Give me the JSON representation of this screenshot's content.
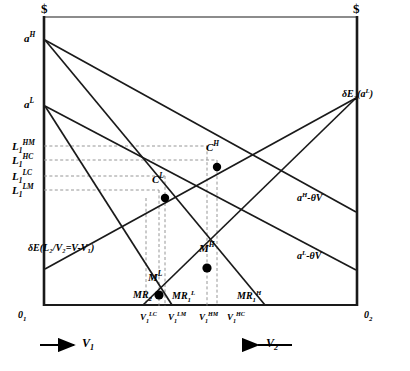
{
  "figure": {
    "type": "economics-diagram",
    "axes": {
      "left_currency_symbol": "$",
      "right_currency_symbol": "$",
      "origin_left": "0",
      "origin_left_sub": "1",
      "origin_right": "0",
      "origin_right_sub": "2"
    },
    "y_axis_intercepts": [
      {
        "id": "a-high",
        "base": "a",
        "sup": "H",
        "x": 30,
        "y": 38
      },
      {
        "id": "a-low",
        "base": "a",
        "sup": "L",
        "x": 30,
        "y": 104
      }
    ],
    "y_axis_ticks": [
      {
        "id": "L1-HM",
        "base": "L",
        "sub": "1",
        "sup": "HM",
        "y": 146
      },
      {
        "id": "L1-HC",
        "base": "L",
        "sub": "1",
        "sup": "HC",
        "y": 160
      },
      {
        "id": "L1-LC",
        "base": "L",
        "sub": "1",
        "sup": "LC",
        "y": 176
      },
      {
        "id": "L1-LM",
        "base": "L",
        "sub": "1",
        "sup": "LM",
        "y": 190
      }
    ],
    "x_axis_ticks": [
      {
        "id": "V1-LC",
        "base": "V",
        "sub": "1",
        "sup": "LC",
        "x": 146
      },
      {
        "id": "V1-LM",
        "base": "V",
        "sub": "1",
        "sup": "LM",
        "x": 172
      },
      {
        "id": "V1-HM",
        "base": "V",
        "sub": "1",
        "sup": "HM",
        "x": 204
      },
      {
        "id": "V1-HC",
        "base": "V",
        "sub": "1",
        "sup": "HC",
        "x": 230
      }
    ],
    "equilibrium_points": [
      {
        "id": "C-high",
        "base": "C",
        "sup": "H",
        "px": 217,
        "py": 167,
        "label_x": 206,
        "label_y": 147
      },
      {
        "id": "C-low",
        "base": "C",
        "sup": "L",
        "px": 165,
        "py": 198,
        "label_x": 155,
        "label_y": 180
      },
      {
        "id": "M-high",
        "base": "M",
        "sup": "H",
        "px": 207,
        "py": 268,
        "label_x": 199,
        "label_y": 248
      },
      {
        "id": "M-low",
        "base": "M",
        "sup": "L",
        "px": 159,
        "py": 295,
        "label_x": 149,
        "label_y": 277
      }
    ],
    "marginal_revenue_labels": [
      {
        "id": "MR2",
        "base": "MR",
        "sub": "2",
        "x": 137,
        "y": 296
      },
      {
        "id": "MR1-L",
        "base": "MR",
        "sub": "1",
        "sup": "L",
        "x": 178,
        "y": 296
      },
      {
        "id": "MR1-H",
        "base": "MR",
        "sub": "1",
        "sup": "H",
        "x": 242,
        "y": 296
      }
    ],
    "curve_labels": [
      {
        "id": "dE2-aL",
        "text_prefix": "δE",
        "sub": "2",
        "paren_open": "(",
        "base": "a",
        "sup": "L",
        "paren_close": ")",
        "x": 344,
        "y": 95
      },
      {
        "id": "aH-thetaV",
        "base": "a",
        "sup": "H",
        "suffix": "-θV",
        "x": 300,
        "y": 198
      },
      {
        "id": "aL-thetaV",
        "base": "a",
        "sup": "L",
        "suffix": "-θV",
        "x": 300,
        "y": 256
      },
      {
        "id": "dE-L2V2",
        "text": "δE(L₂/V₂=V-V₁)",
        "x": 28,
        "y": 248
      }
    ],
    "direction_arrows": [
      {
        "id": "v1-direction",
        "base": "V",
        "sub": "1",
        "label_x": 82,
        "label_y": 341,
        "arrow_dir": "right"
      },
      {
        "id": "v2-direction",
        "base": "V",
        "sub": "2",
        "label_x": 268,
        "label_y": 341,
        "arrow_dir": "left"
      }
    ],
    "colors": {
      "line": "#1a1a1a",
      "dashed_guide": "#808080",
      "background": "#ffffff",
      "point_fill": "#000000"
    }
  }
}
